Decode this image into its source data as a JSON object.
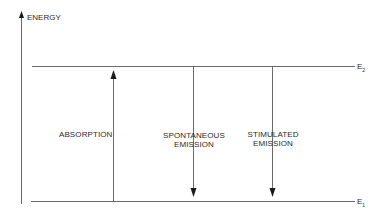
{
  "axis": {
    "label": "ENERGY"
  },
  "levels": [
    {
      "name": "E",
      "subscript": "2",
      "y": 66
    },
    {
      "name": "E",
      "subscript": "1",
      "y": 201
    }
  ],
  "transitions": [
    {
      "line1": "ABSORPTION",
      "line2": "",
      "direction": "up",
      "x": 113
    },
    {
      "line1": "SPONTANEOUS",
      "line2": "EMISSION",
      "direction": "down",
      "x": 193
    },
    {
      "line1": "STIMULATED",
      "line2": "EMISSION",
      "direction": "down",
      "x": 272
    }
  ],
  "colors": {
    "line": "#6a6a6a",
    "arrowhead": "#1a1a1a",
    "text": "#2a2a2a"
  }
}
